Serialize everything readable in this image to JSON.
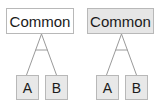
{
  "diagram": {
    "groups": [
      {
        "parent": {
          "label": "Common",
          "fill": "#ffffff"
        },
        "children": [
          {
            "label": "A"
          },
          {
            "label": "B"
          }
        ]
      },
      {
        "parent": {
          "label": "Common",
          "fill": "#e6e6e6"
        },
        "children": [
          {
            "label": "A"
          },
          {
            "label": "B"
          }
        ]
      }
    ],
    "colors": {
      "border": "#b8b8b8",
      "line": "#9a9a9a",
      "child_fill": "#e8e8e8"
    }
  }
}
